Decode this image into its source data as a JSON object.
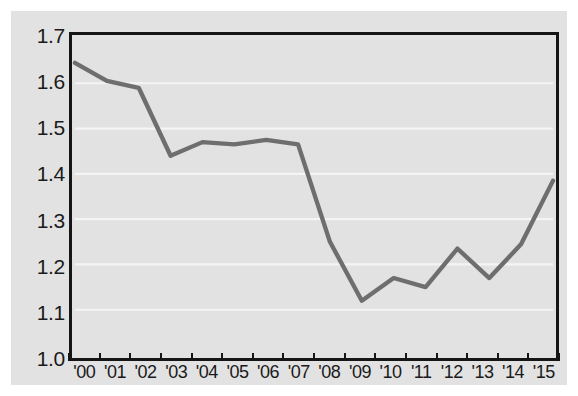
{
  "figure": {
    "background_color": "#e2e2e2",
    "outer_background_color": "#ffffff",
    "frame_color": "#151515",
    "gridline_color": "#f4f4f4",
    "line_color": "#6e6e6e"
  },
  "chart_data": {
    "type": "line",
    "title": "",
    "subtitle": "",
    "xlabel": "",
    "ylabel": "",
    "categories": [
      "'00",
      "'01",
      "'02",
      "'03",
      "'04",
      "'05",
      "'06",
      "'07",
      "'08",
      "'09",
      "'10",
      "'11",
      "'12",
      "'13",
      "'14",
      "'15"
    ],
    "x": [
      2000,
      2001,
      2002,
      2003,
      2004,
      2005,
      2006,
      2007,
      2008,
      2009,
      2010,
      2011,
      2012,
      2013,
      2014,
      2015
    ],
    "values": [
      1.645,
      1.605,
      1.59,
      1.44,
      1.47,
      1.465,
      1.475,
      1.465,
      1.25,
      1.12,
      1.17,
      1.15,
      1.235,
      1.17,
      1.245,
      1.385
    ],
    "ylim": [
      1.0,
      1.7
    ],
    "ytick_labels": [
      "1.0",
      "1.1",
      "1.2",
      "1.3",
      "1.4",
      "1.5",
      "1.6",
      "1.7"
    ],
    "ytick_values": [
      1.0,
      1.1,
      1.2,
      1.3,
      1.4,
      1.5,
      1.6,
      1.7
    ],
    "xtick_labels": [
      "'00",
      "'01",
      "'02",
      "'03",
      "'04",
      "'05",
      "'06",
      "'07",
      "'08",
      "'09",
      "'10",
      "'11",
      "'12",
      "'13",
      "'14",
      "'15"
    ],
    "grid": "horizontal",
    "legend": [],
    "legend_position": "none",
    "annotations": []
  }
}
